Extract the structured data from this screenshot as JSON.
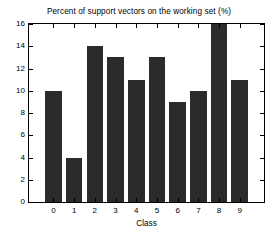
{
  "chart_data": {
    "type": "bar",
    "title": "Percent of support vectors on the working set (%)",
    "xlabel": "Class",
    "ylabel": "",
    "categories": [
      "0",
      "1",
      "2",
      "3",
      "4",
      "5",
      "6",
      "7",
      "8",
      "9"
    ],
    "values": [
      10,
      4,
      14,
      13,
      11,
      13,
      9,
      10,
      16,
      11
    ],
    "ylim": [
      0,
      16
    ],
    "yticks": [
      0,
      2,
      4,
      6,
      8,
      10,
      12,
      14,
      16
    ],
    "ytick_labels": [
      "0",
      "2",
      "4",
      "6",
      "8",
      "10",
      "12",
      "14",
      "16"
    ],
    "xtick_labels": [
      "0",
      "1",
      "2",
      "3",
      "4",
      "5",
      "6",
      "7",
      "8",
      "9"
    ],
    "grid": false,
    "legend": null,
    "bar_color": "#2b2b2b",
    "axis_color": "#000000",
    "background_color": "#ffffff"
  }
}
